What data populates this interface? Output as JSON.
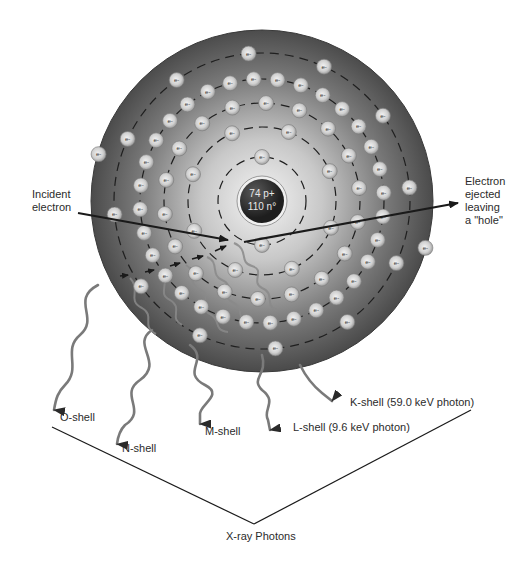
{
  "nucleus": {
    "line1": "74 p+",
    "line2": "110 n°",
    "protons": 74,
    "neutrons": 110
  },
  "electron_symbol": "e-",
  "labels": {
    "incident": "Incident\nelectron",
    "incident_line1": "Incident",
    "incident_line2": "electron",
    "ejected_line1": "Electron",
    "ejected_line2": "ejected",
    "ejected_line3": "leaving",
    "ejected_line4": "a \"hole\"",
    "o_shell": "O-shell",
    "n_shell": "N-shell",
    "m_shell": "M-shell",
    "l_shell": "L-shell (9.6 keV photon)",
    "k_shell": "K-shell (59.0 keV photon)",
    "xray_photons": "X-ray Photons"
  },
  "shells": [
    {
      "name": "K",
      "radius": 44,
      "electron_count": 2,
      "photon_energy_keV": 59.0
    },
    {
      "name": "L",
      "radius": 74,
      "electron_count": 8,
      "photon_energy_keV": 9.6
    },
    {
      "name": "M",
      "radius": 98,
      "electron_count": 18
    },
    {
      "name": "N",
      "radius": 122,
      "electron_count": 32
    },
    {
      "name": "O",
      "radius": 148,
      "electron_count": 12
    },
    {
      "name": "P",
      "radius": 170,
      "electron_count": 2
    }
  ],
  "colors": {
    "sphere_outer": "#4a4a4a",
    "sphere_inner": "#f2f2f2",
    "nucleus": "#2a2a2a",
    "electron_fill": "#d9d9d9",
    "photon_path": "#7a7a7a",
    "arrow": "#1a1a1a"
  }
}
